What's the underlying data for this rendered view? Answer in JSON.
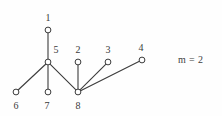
{
  "figure": {
    "kind": "undirected-graph-diagram",
    "background_color": "#fefefe",
    "stroke_color": "#3b3b3b",
    "node_fill_color": "#ffffff",
    "label_color": "#3a3a3a"
  },
  "annotation": {
    "text": "m = 2"
  },
  "graph": {
    "node_radius": 2.9,
    "nodes": [
      {
        "id": "1",
        "label": "1",
        "cx": 48,
        "cy": 30,
        "label_x": 48,
        "label_y": 13
      },
      {
        "id": "2",
        "label": "2",
        "cx": 78,
        "cy": 62,
        "label_x": 78,
        "label_y": 45
      },
      {
        "id": "3",
        "label": "3",
        "cx": 108,
        "cy": 62,
        "label_x": 108,
        "label_y": 45
      },
      {
        "id": "4",
        "label": "4",
        "cx": 142,
        "cy": 60,
        "label_x": 141,
        "label_y": 43
      },
      {
        "id": "5",
        "label": "5",
        "cx": 48,
        "cy": 62,
        "label_x": 56,
        "label_y": 45
      },
      {
        "id": "6",
        "label": "6",
        "cx": 16,
        "cy": 92,
        "label_x": 16,
        "label_y": 101
      },
      {
        "id": "7",
        "label": "7",
        "cx": 48,
        "cy": 92,
        "label_x": 47,
        "label_y": 101
      },
      {
        "id": "8",
        "label": "8",
        "cx": 78,
        "cy": 92,
        "label_x": 78,
        "label_y": 101
      }
    ],
    "edges": [
      {
        "from": "1",
        "to": "5"
      },
      {
        "from": "5",
        "to": "6"
      },
      {
        "from": "5",
        "to": "7"
      },
      {
        "from": "5",
        "to": "8"
      },
      {
        "from": "2",
        "to": "8"
      },
      {
        "from": "3",
        "to": "8"
      },
      {
        "from": "4",
        "to": "8"
      }
    ]
  }
}
